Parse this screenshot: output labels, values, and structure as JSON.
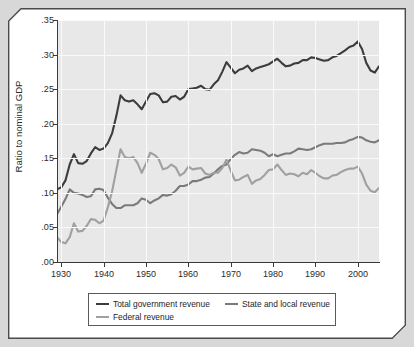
{
  "chart_data": {
    "type": "line",
    "title": "",
    "xlabel": "",
    "ylabel": "Ratio to nominal GDP",
    "xlim": [
      1929,
      2005
    ],
    "ylim": [
      0.0,
      0.35
    ],
    "grid": true,
    "legend_position": "bottom",
    "ytick_labels": [
      ".35",
      ".30",
      ".25",
      ".20",
      ".15",
      ".10",
      ".05",
      ".00"
    ],
    "ytick_values": [
      0.35,
      0.3,
      0.25,
      0.2,
      0.15,
      0.1,
      0.05,
      0.0
    ],
    "xtick_labels": [
      "1930",
      "1940",
      "1950",
      "1960",
      "1970",
      "1980",
      "1990",
      "2000"
    ],
    "xtick_values": [
      1930,
      1940,
      1950,
      1960,
      1970,
      1980,
      1990,
      2000
    ],
    "x": [
      1929,
      1930,
      1931,
      1932,
      1933,
      1934,
      1935,
      1936,
      1937,
      1938,
      1939,
      1940,
      1941,
      1942,
      1943,
      1944,
      1945,
      1946,
      1947,
      1948,
      1949,
      1950,
      1951,
      1952,
      1953,
      1954,
      1955,
      1956,
      1957,
      1958,
      1959,
      1960,
      1961,
      1962,
      1963,
      1964,
      1965,
      1966,
      1967,
      1968,
      1969,
      1970,
      1971,
      1972,
      1973,
      1974,
      1975,
      1976,
      1977,
      1978,
      1979,
      1980,
      1981,
      1982,
      1983,
      1984,
      1985,
      1986,
      1987,
      1988,
      1989,
      1990,
      1991,
      1992,
      1993,
      1994,
      1995,
      1996,
      1997,
      1998,
      1999,
      2000,
      2001,
      2002,
      2003,
      2004,
      2005
    ],
    "series": [
      {
        "name": "Total government revenue",
        "color": "#3c3c3c",
        "values": [
          0.105,
          0.108,
          0.118,
          0.141,
          0.156,
          0.143,
          0.142,
          0.146,
          0.157,
          0.166,
          0.162,
          0.164,
          0.172,
          0.186,
          0.211,
          0.241,
          0.234,
          0.232,
          0.234,
          0.228,
          0.221,
          0.232,
          0.243,
          0.244,
          0.241,
          0.231,
          0.232,
          0.239,
          0.24,
          0.235,
          0.239,
          0.25,
          0.251,
          0.252,
          0.255,
          0.25,
          0.249,
          0.257,
          0.263,
          0.275,
          0.289,
          0.281,
          0.273,
          0.278,
          0.28,
          0.284,
          0.276,
          0.28,
          0.282,
          0.284,
          0.286,
          0.29,
          0.294,
          0.288,
          0.283,
          0.284,
          0.287,
          0.288,
          0.292,
          0.292,
          0.296,
          0.295,
          0.293,
          0.291,
          0.292,
          0.296,
          0.298,
          0.302,
          0.306,
          0.311,
          0.313,
          0.319,
          0.308,
          0.288,
          0.277,
          0.274,
          0.283
        ]
      },
      {
        "name": "State and local revenue",
        "color": "#7a7a7a",
        "values": [
          0.069,
          0.08,
          0.091,
          0.105,
          0.1,
          0.099,
          0.097,
          0.094,
          0.095,
          0.105,
          0.106,
          0.104,
          0.093,
          0.084,
          0.078,
          0.078,
          0.082,
          0.082,
          0.082,
          0.085,
          0.092,
          0.09,
          0.085,
          0.089,
          0.092,
          0.097,
          0.096,
          0.098,
          0.103,
          0.11,
          0.11,
          0.112,
          0.117,
          0.117,
          0.119,
          0.122,
          0.123,
          0.128,
          0.134,
          0.139,
          0.141,
          0.149,
          0.155,
          0.159,
          0.157,
          0.158,
          0.163,
          0.162,
          0.161,
          0.158,
          0.153,
          0.156,
          0.153,
          0.155,
          0.157,
          0.157,
          0.16,
          0.164,
          0.163,
          0.162,
          0.163,
          0.166,
          0.169,
          0.171,
          0.171,
          0.171,
          0.172,
          0.172,
          0.173,
          0.176,
          0.178,
          0.181,
          0.18,
          0.176,
          0.174,
          0.173,
          0.176
        ]
      },
      {
        "name": "Federal revenue",
        "color": "#a0a0a0",
        "values": [
          0.036,
          0.029,
          0.027,
          0.036,
          0.056,
          0.044,
          0.045,
          0.052,
          0.062,
          0.061,
          0.056,
          0.06,
          0.079,
          0.102,
          0.133,
          0.163,
          0.152,
          0.15,
          0.152,
          0.143,
          0.129,
          0.142,
          0.158,
          0.155,
          0.149,
          0.134,
          0.136,
          0.141,
          0.137,
          0.125,
          0.129,
          0.138,
          0.134,
          0.135,
          0.136,
          0.128,
          0.126,
          0.129,
          0.129,
          0.136,
          0.148,
          0.132,
          0.118,
          0.119,
          0.123,
          0.126,
          0.113,
          0.118,
          0.12,
          0.126,
          0.133,
          0.134,
          0.141,
          0.133,
          0.126,
          0.128,
          0.127,
          0.124,
          0.129,
          0.127,
          0.133,
          0.129,
          0.124,
          0.121,
          0.121,
          0.125,
          0.126,
          0.13,
          0.133,
          0.135,
          0.135,
          0.138,
          0.128,
          0.112,
          0.103,
          0.101,
          0.107
        ]
      }
    ]
  },
  "legend": {
    "entries": [
      {
        "label": "Total government revenue"
      },
      {
        "label": "State and local revenue"
      },
      {
        "label": "Federal revenue"
      }
    ]
  },
  "axes": {
    "y_title": "Ratio to nominal GDP"
  }
}
